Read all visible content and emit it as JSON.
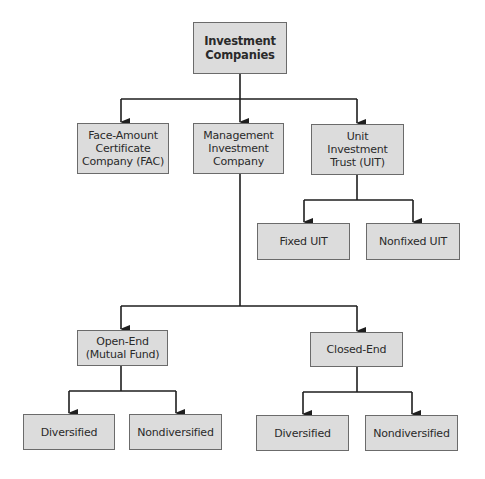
{
  "diagram": {
    "type": "org-chart",
    "root": {
      "id": "investment-companies",
      "label": "Investment\nCompanies"
    },
    "level1": [
      {
        "id": "fac",
        "label": "Face-Amount\nCertificate\nCompany (FAC)"
      },
      {
        "id": "management",
        "label": "Management\nInvestment\nCompany"
      },
      {
        "id": "uit",
        "label": "Unit\nInvestment\nTrust (UIT)"
      }
    ],
    "uit_children": [
      {
        "id": "fixed-uit",
        "label": "Fixed UIT"
      },
      {
        "id": "nonfixed-uit",
        "label": "Nonfixed UIT"
      }
    ],
    "management_children": [
      {
        "id": "open-end",
        "label": "Open-End\n(Mutual Fund)"
      },
      {
        "id": "closed-end",
        "label": "Closed-End"
      }
    ],
    "open_end_children": [
      {
        "id": "open-diversified",
        "label": "Diversified"
      },
      {
        "id": "open-nondiversified",
        "label": "Nondiversified"
      }
    ],
    "closed_end_children": [
      {
        "id": "closed-diversified",
        "label": "Diversified"
      },
      {
        "id": "closed-nondiversified",
        "label": "Nondiversified"
      }
    ],
    "edges": [
      [
        "investment-companies",
        "fac"
      ],
      [
        "investment-companies",
        "management"
      ],
      [
        "investment-companies",
        "uit"
      ],
      [
        "uit",
        "fixed-uit"
      ],
      [
        "uit",
        "nonfixed-uit"
      ],
      [
        "management",
        "open-end"
      ],
      [
        "management",
        "closed-end"
      ],
      [
        "open-end",
        "open-diversified"
      ],
      [
        "open-end",
        "open-nondiversified"
      ],
      [
        "closed-end",
        "closed-diversified"
      ],
      [
        "closed-end",
        "closed-nondiversified"
      ]
    ],
    "colors": {
      "box_fill": "#dcdcdc",
      "box_border": "#6b6b6b",
      "line": "#1e1e1e",
      "text": "#2a2a2a"
    }
  }
}
